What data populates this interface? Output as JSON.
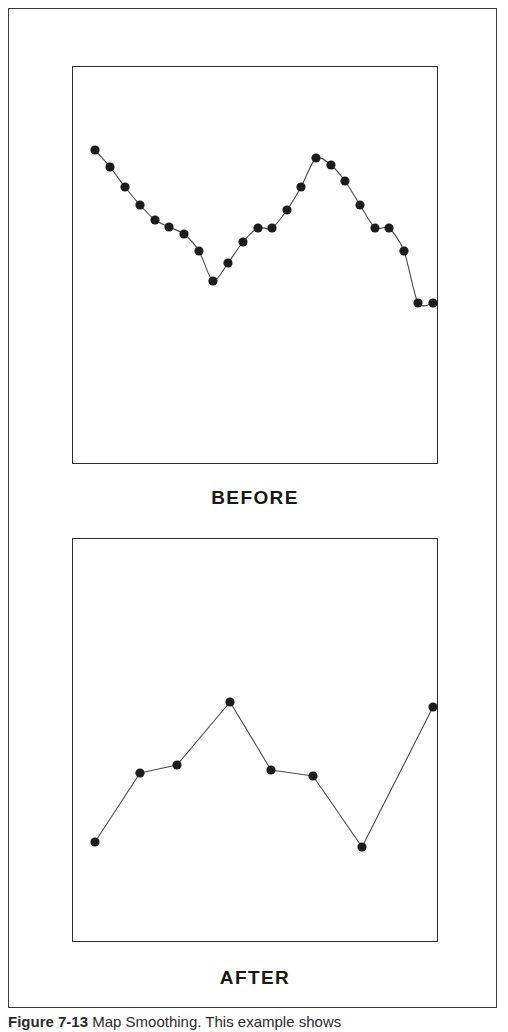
{
  "figure": {
    "caption_label": "Figure 7-13",
    "caption_text": "  Map Smoothing. This example shows",
    "border_color": "#3b3b3b",
    "background": "#ffffff"
  },
  "panels": [
    {
      "id": "before",
      "label": "BEFORE",
      "box_border_color": "#2d2d2d"
    },
    {
      "id": "after",
      "label": "AFTER",
      "box_border_color": "#2d2d2d"
    }
  ],
  "style": {
    "marker_color": "#1c1c1c",
    "line_color": "#4a4a4a",
    "marker_radius": 4.6,
    "line_width": 1.1
  },
  "chart_data": [
    {
      "type": "line",
      "title": "BEFORE",
      "subtitle": "",
      "xlabel": "",
      "ylabel": "",
      "grid": false,
      "legend": "none",
      "interpolation": "smooth",
      "markers": true,
      "xlim": [
        0,
        366
      ],
      "ylim": [
        0,
        398
      ],
      "note": "Unlabeled schematic map-smoothing curve; values are panel-relative positions read off the plot box.",
      "x": [
        23,
        38,
        53,
        68,
        83,
        97,
        112,
        127,
        141,
        156,
        171,
        186,
        200,
        215,
        229,
        244,
        259,
        273,
        288,
        303,
        317,
        332,
        346,
        361
      ],
      "values": [
        314,
        297,
        277,
        259,
        244,
        237,
        230,
        213,
        183,
        201,
        222,
        236,
        236,
        254,
        277,
        306,
        299,
        283,
        259,
        236,
        236,
        213,
        161,
        161
      ],
      "y_pixel_note": "values are distance up from the panel bottom, panel height 398"
    },
    {
      "type": "line",
      "title": "AFTER",
      "subtitle": "",
      "xlabel": "",
      "ylabel": "",
      "grid": false,
      "legend": "none",
      "interpolation": "linear",
      "markers": true,
      "xlim": [
        0,
        366
      ],
      "ylim": [
        0,
        404
      ],
      "note": "Smoothed/ generalized version of the BEFORE series retaining 8 vertices.",
      "x": [
        23,
        68,
        105,
        158,
        199,
        241,
        290,
        361
      ],
      "values": [
        100,
        169,
        177,
        240,
        172,
        166,
        95,
        235
      ],
      "y_pixel_note": "values are distance up from the panel bottom, panel height 404"
    }
  ]
}
